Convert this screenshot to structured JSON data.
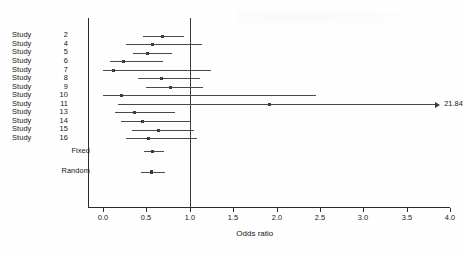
{
  "chart_data": {
    "type": "forest",
    "title": "",
    "xlabel": "Odds ratio",
    "ylabel": "",
    "xlim": [
      0.0,
      4.0
    ],
    "xticks": [
      "0.0",
      "0.5",
      "1.0",
      "1.5",
      "2.0",
      "2.5",
      "3.0",
      "3.5",
      "4.0"
    ],
    "xtick_values": [
      0.0,
      0.5,
      1.0,
      1.5,
      2.0,
      2.5,
      3.0,
      3.5,
      4.0
    ],
    "reference_line": 1.0,
    "grid": false,
    "legend": "none",
    "marker_shape": "square",
    "categories": [
      "Study  2",
      "Study  4",
      "Study  5",
      "Study  6",
      "Study  7",
      "Study  8",
      "Study  9",
      "Study 10",
      "Study 11",
      "Study 13",
      "Study 14",
      "Study 15",
      "Study 16",
      "Fixed",
      "Random"
    ],
    "rows": [
      {
        "label_name": "Study",
        "label_num": "2",
        "label": "Study  2",
        "kind": "study",
        "estimate": 0.69,
        "ci_low": 0.46,
        "ci_high": 0.93,
        "arrow_right": false,
        "annotation": ""
      },
      {
        "label_name": "Study",
        "label_num": "4",
        "label": "Study  4",
        "kind": "study",
        "estimate": 0.57,
        "ci_low": 0.27,
        "ci_high": 1.14,
        "arrow_right": false,
        "annotation": ""
      },
      {
        "label_name": "Study",
        "label_num": "5",
        "label": "Study  5",
        "kind": "study",
        "estimate": 0.51,
        "ci_low": 0.35,
        "ci_high": 0.79,
        "arrow_right": false,
        "annotation": ""
      },
      {
        "label_name": "Study",
        "label_num": "6",
        "label": "Study  6",
        "kind": "study",
        "estimate": 0.24,
        "ci_low": 0.08,
        "ci_high": 0.69,
        "arrow_right": false,
        "annotation": ""
      },
      {
        "label_name": "Study",
        "label_num": "7",
        "label": "Study  7",
        "kind": "study",
        "estimate": 0.12,
        "ci_low": 0.0,
        "ci_high": 1.25,
        "arrow_right": false,
        "annotation": ""
      },
      {
        "label_name": "Study",
        "label_num": "8",
        "label": "Study  8",
        "kind": "study",
        "estimate": 0.68,
        "ci_low": 0.4,
        "ci_high": 1.12,
        "arrow_right": false,
        "annotation": ""
      },
      {
        "label_name": "Study",
        "label_num": "9",
        "label": "Study  9",
        "kind": "study",
        "estimate": 0.78,
        "ci_low": 0.5,
        "ci_high": 1.15,
        "arrow_right": false,
        "annotation": ""
      },
      {
        "label_name": "Study",
        "label_num": "10",
        "label": "Study 10",
        "kind": "study",
        "estimate": 0.21,
        "ci_low": 0.0,
        "ci_high": 2.45,
        "arrow_right": false,
        "annotation": ""
      },
      {
        "label_name": "Study",
        "label_num": "11",
        "label": "Study 11",
        "kind": "study",
        "estimate": 1.92,
        "ci_low": 0.17,
        "ci_high": 21.84,
        "arrow_right": true,
        "annotation": "21.84"
      },
      {
        "label_name": "Study",
        "label_num": "13",
        "label": "Study 13",
        "kind": "study",
        "estimate": 0.36,
        "ci_low": 0.14,
        "ci_high": 0.83,
        "arrow_right": false,
        "annotation": ""
      },
      {
        "label_name": "Study",
        "label_num": "14",
        "label": "Study 14",
        "kind": "study",
        "estimate": 0.46,
        "ci_low": 0.21,
        "ci_high": 1.0,
        "arrow_right": false,
        "annotation": ""
      },
      {
        "label_name": "Study",
        "label_num": "15",
        "label": "Study 15",
        "kind": "study",
        "estimate": 0.64,
        "ci_low": 0.33,
        "ci_high": 1.05,
        "arrow_right": false,
        "annotation": ""
      },
      {
        "label_name": "Study",
        "label_num": "16",
        "label": "Study 16",
        "kind": "study",
        "estimate": 0.52,
        "ci_low": 0.26,
        "ci_high": 1.08,
        "arrow_right": false,
        "annotation": ""
      },
      {
        "label_name": "Fixed",
        "label_num": "",
        "label": "Fixed",
        "kind": "summary",
        "estimate": 0.57,
        "ci_low": 0.47,
        "ci_high": 0.7,
        "arrow_right": false,
        "annotation": ""
      },
      {
        "label_name": "Random",
        "label_num": "",
        "label": "Random",
        "kind": "summary",
        "estimate": 0.56,
        "ci_low": 0.44,
        "ci_high": 0.71,
        "arrow_right": false,
        "annotation": ""
      }
    ]
  },
  "colors": {
    "axis": "#2b2b2b",
    "reference_line": "#3a3a3a",
    "ci_line": "#4a4a4a",
    "marker": "#3d3d3d",
    "text": "#161616",
    "background": "#ffffff"
  }
}
